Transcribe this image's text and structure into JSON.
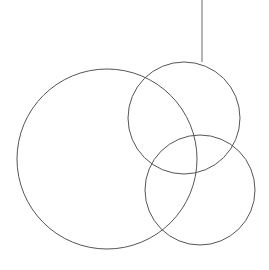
{
  "canvas": {
    "width": 269,
    "height": 270,
    "background_color": "#ffffff",
    "title": "Three overlapping circles with a suspension line"
  },
  "style": {
    "stroke_color": "#55555a",
    "stroke_color_alt": "#6b6b70",
    "stroke_width": 1,
    "fill": "none"
  },
  "shapes": [
    {
      "id": "circle-large",
      "name": "large-circle",
      "type": "circle",
      "cx": 107,
      "cy": 159,
      "r": 90,
      "stroke": "#55555a",
      "stroke_width": 1,
      "fill": "none"
    },
    {
      "id": "circle-upper-right",
      "name": "upper-right-circle",
      "type": "circle",
      "cx": 184,
      "cy": 118,
      "r": 56,
      "stroke": "#55555a",
      "stroke_width": 1,
      "fill": "none"
    },
    {
      "id": "circle-lower-right",
      "name": "lower-right-circle",
      "type": "circle",
      "cx": 200,
      "cy": 190,
      "r": 55,
      "stroke": "#55555a",
      "stroke_width": 1,
      "fill": "none"
    },
    {
      "id": "line-suspension",
      "name": "suspension-line",
      "type": "line",
      "x1": 202,
      "y1": 0,
      "x2": 202,
      "y2": 62,
      "stroke": "#6b6b70",
      "stroke_width": 1
    }
  ]
}
